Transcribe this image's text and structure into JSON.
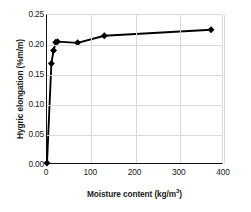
{
  "chart_data": {
    "type": "line",
    "title": "",
    "xlabel": "Moisture content (kg/m3)",
    "xlabel_base": "Moisture content (kg/m",
    "xlabel_exp": "3",
    "xlabel_tail": ")",
    "ylabel": "Hygric elongation (%m/m)",
    "ylabel_base": "Hygric elongation (%m/m)",
    "xlim": [
      0,
      400
    ],
    "ylim": [
      0.0,
      0.25
    ],
    "xticks": [
      0,
      100,
      200,
      300,
      400
    ],
    "xtick_labels": [
      "0",
      "100",
      "200",
      "300",
      "400"
    ],
    "yticks": [
      0.0,
      0.05,
      0.1,
      0.15,
      0.2,
      0.25
    ],
    "ytick_labels": [
      "0.00",
      "0.05",
      "0.10",
      "0.15",
      "0.20",
      "0.25"
    ],
    "grid": true,
    "legend": false,
    "marker": "diamond",
    "line_color": "#000000",
    "marker_color": "#000000",
    "grid_color": "#d9d9d9",
    "axis_color": "#111111",
    "x": [
      0,
      10,
      15,
      20,
      24,
      70,
      131,
      375
    ],
    "y": [
      0.0,
      0.168,
      0.19,
      0.204,
      0.205,
      0.203,
      0.215,
      0.225
    ],
    "points": [
      {
        "x": 0,
        "y": 0.0
      },
      {
        "x": 10,
        "y": 0.168
      },
      {
        "x": 15,
        "y": 0.19
      },
      {
        "x": 20,
        "y": 0.204
      },
      {
        "x": 24,
        "y": 0.205
      },
      {
        "x": 70,
        "y": 0.203
      },
      {
        "x": 131,
        "y": 0.215
      },
      {
        "x": 375,
        "y": 0.225
      }
    ]
  }
}
